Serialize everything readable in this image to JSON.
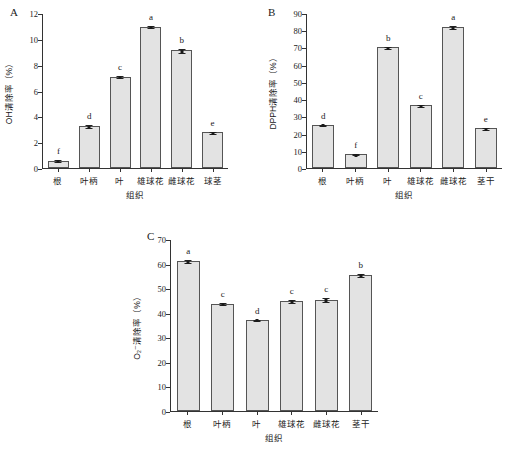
{
  "figure": {
    "background": "#ffffff",
    "bar_fill": "#e3e3e3",
    "bar_stroke": "#555555",
    "axis_color": "#333333"
  },
  "chart_data": [
    {
      "type": "bar",
      "panel": "A",
      "title": "",
      "xlabel": "组织",
      "ylabel": "OH清除率（%）",
      "categories": [
        "根",
        "叶柄",
        "叶",
        "雄球花",
        "雌球花",
        "球茎"
      ],
      "values": [
        0.55,
        3.25,
        7.05,
        10.95,
        9.1,
        2.75
      ],
      "errors": [
        0.12,
        0.12,
        0.12,
        0.1,
        0.22,
        0.12
      ],
      "sig_letters": [
        "f",
        "d",
        "c",
        "a",
        "b",
        "e"
      ],
      "ylim": [
        0,
        12
      ],
      "yticks": [
        0,
        2,
        4,
        6,
        8,
        10,
        12
      ],
      "grid": false,
      "legend": "none"
    },
    {
      "type": "bar",
      "panel": "B",
      "title": "",
      "xlabel": "组织",
      "ylabel": "DPPH清除率（%）",
      "categories": [
        "根",
        "叶柄",
        "叶",
        "雄球花",
        "雌球花",
        "茎干"
      ],
      "values": [
        25.2,
        8.1,
        70.0,
        36.3,
        81.7,
        23.2
      ],
      "errors": [
        0.6,
        0.5,
        0.8,
        0.9,
        1.1,
        0.9
      ],
      "sig_letters": [
        "d",
        "f",
        "b",
        "c",
        "a",
        "e"
      ],
      "ylim": [
        0,
        90
      ],
      "yticks": [
        0,
        10,
        20,
        30,
        40,
        50,
        60,
        70,
        80,
        90
      ],
      "grid": false,
      "legend": "none"
    },
    {
      "type": "bar",
      "panel": "C",
      "title": "",
      "xlabel": "组织",
      "ylabel": "O₂⁻清除率（%）",
      "categories": [
        "根",
        "叶柄",
        "叶",
        "雄球花",
        "雌球花",
        "茎干"
      ],
      "values": [
        61.0,
        43.7,
        37.2,
        44.8,
        45.3,
        55.5
      ],
      "errors": [
        0.9,
        0.5,
        0.4,
        0.9,
        1.0,
        0.8
      ],
      "sig_letters": [
        "a",
        "c",
        "d",
        "c",
        "c",
        "b"
      ],
      "ylim": [
        0,
        70
      ],
      "yticks": [
        0,
        10,
        20,
        30,
        40,
        50,
        60,
        70
      ],
      "grid": false,
      "legend": "none"
    }
  ]
}
